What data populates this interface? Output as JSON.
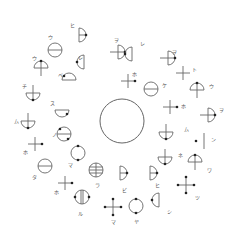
{
  "diagram": {
    "center": {
      "cx": 122,
      "cy": 121,
      "r": 22
    },
    "stroke": "#666666",
    "dot": "#222222",
    "symbols": [
      {
        "id": 1,
        "type": "half-right",
        "x": 79,
        "y": 35,
        "label": "ヒ",
        "lx": 70,
        "ly": 23
      },
      {
        "id": 2,
        "type": "circle-h",
        "x": 55,
        "y": 50,
        "label": "ウ",
        "lx": 48,
        "ly": 35
      },
      {
        "id": 3,
        "type": "half-left",
        "x": 84,
        "y": 62,
        "label": "レ",
        "lx": 78,
        "ly": 55
      },
      {
        "id": 4,
        "type": "umbrella-up",
        "x": 41,
        "y": 68,
        "label": "ウ",
        "lx": 32,
        "ly": 56
      },
      {
        "id": 5,
        "type": "dome-dot",
        "x": 69,
        "y": 80,
        "label": "ベ",
        "lx": 58,
        "ly": 73
      },
      {
        "id": 6,
        "type": "bowl-stem",
        "x": 33,
        "y": 93,
        "label": "チ",
        "lx": 22,
        "ly": 84
      },
      {
        "id": 7,
        "type": "bowl-dot",
        "x": 62,
        "y": 110,
        "label": "ス",
        "lx": 50,
        "ly": 101
      },
      {
        "id": 8,
        "type": "bowl-stem",
        "x": 28,
        "y": 121,
        "label": "ム",
        "lx": 14,
        "ly": 119
      },
      {
        "id": 9,
        "type": "circle-hdot",
        "x": 64,
        "y": 134,
        "label": "ノ",
        "lx": 52,
        "ly": 132
      },
      {
        "id": 10,
        "type": "cross-dot",
        "x": 35,
        "y": 144,
        "label": "ホ",
        "lx": 23,
        "ly": 150
      },
      {
        "id": 11,
        "type": "circle-vdot",
        "x": 78,
        "y": 153,
        "label": "マ",
        "lx": 68,
        "ly": 163
      },
      {
        "id": 12,
        "type": "circle-h",
        "x": 45,
        "y": 166,
        "label": "タ",
        "lx": 32,
        "ly": 175
      },
      {
        "id": 13,
        "type": "circle-grid",
        "x": 96,
        "y": 170,
        "label": "ラ",
        "lx": 95,
        "ly": 183
      },
      {
        "id": 14,
        "type": "cross-dot",
        "x": 65,
        "y": 183,
        "label": "ホ",
        "lx": 54,
        "ly": 190
      },
      {
        "id": 15,
        "type": "circle-v2",
        "x": 82,
        "y": 197,
        "label": "ル",
        "lx": 78,
        "ly": 211
      },
      {
        "id": 16,
        "type": "half-right",
        "x": 120,
        "y": 173,
        "label": "ビ",
        "lx": 122,
        "ly": 188
      },
      {
        "id": 17,
        "type": "half-right",
        "x": 150,
        "y": 173,
        "label": "ヒ",
        "lx": 155,
        "ly": 183
      },
      {
        "id": 18,
        "type": "plus-dots",
        "x": 113,
        "y": 207,
        "label": "マ",
        "lx": 111,
        "ly": 220
      },
      {
        "id": 19,
        "type": "circle-vdot",
        "x": 136,
        "y": 206,
        "label": "ヤ",
        "lx": 134,
        "ly": 219
      },
      {
        "id": 20,
        "type": "half-left",
        "x": 159,
        "y": 200,
        "label": "シ",
        "lx": 167,
        "ly": 209
      },
      {
        "id": 21,
        "type": "bowl-stem",
        "x": 166,
        "y": 132,
        "label": "ム",
        "lx": 184,
        "ly": 127
      },
      {
        "id": 22,
        "type": "bar",
        "x": 204,
        "y": 141,
        "label": "ン",
        "lx": 211,
        "ly": 137
      },
      {
        "id": 23,
        "type": "bowl-stem",
        "x": 165,
        "y": 157,
        "label": "ネ",
        "lx": 178,
        "ly": 153
      },
      {
        "id": 24,
        "type": "umbrella-up",
        "x": 195,
        "y": 162,
        "label": "ワ",
        "lx": 207,
        "ly": 168
      },
      {
        "id": 25,
        "type": "plus-dots",
        "x": 186,
        "y": 185,
        "label": "ツ",
        "lx": 195,
        "ly": 195
      },
      {
        "id": 26,
        "type": "half-right-stem",
        "x": 118,
        "y": 52,
        "label": "ヲ",
        "lx": 114,
        "ly": 38
      },
      {
        "id": 27,
        "type": "half-left",
        "x": 132,
        "y": 54,
        "label": "レ",
        "lx": 140,
        "ly": 41
      },
      {
        "id": 28,
        "type": "half-right-stem",
        "x": 168,
        "y": 58,
        "label": "ヲ",
        "lx": 172,
        "ly": 50
      },
      {
        "id": 29,
        "type": "cross",
        "x": 183,
        "y": 73,
        "label": "ト",
        "lx": 192,
        "ly": 67
      },
      {
        "id": 30,
        "type": "cross-dot",
        "x": 128,
        "y": 81,
        "label": "ホ",
        "lx": 132,
        "ly": 72
      },
      {
        "id": 31,
        "type": "circle-h",
        "x": 151,
        "y": 89,
        "label": "ケ",
        "lx": 162,
        "ly": 83
      },
      {
        "id": 32,
        "type": "umbrella-up",
        "x": 197,
        "y": 90,
        "label": "ウ",
        "lx": 209,
        "ly": 84
      },
      {
        "id": 33,
        "type": "cross-dot",
        "x": 170,
        "y": 107,
        "label": "ホ",
        "lx": 181,
        "ly": 104
      },
      {
        "id": 34,
        "type": "half-right-stem",
        "x": 208,
        "y": 115,
        "label": "ヲ",
        "lx": 219,
        "ly": 108
      },
      {
        "id": 35,
        "type": "dot",
        "x": 196,
        "y": 141,
        "label": "",
        "lx": 0,
        "ly": 0
      }
    ]
  }
}
